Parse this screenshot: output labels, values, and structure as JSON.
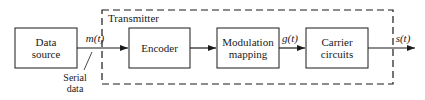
{
  "diagram": {
    "container_label": "Transmitter",
    "blocks": [
      {
        "id": "data-source",
        "lines": [
          "Data",
          "source"
        ]
      },
      {
        "id": "encoder",
        "lines": [
          "Encoder"
        ]
      },
      {
        "id": "modulation-mapping",
        "lines": [
          "Modulation",
          "mapping"
        ]
      },
      {
        "id": "carrier-circuits",
        "lines": [
          "Carrier",
          "circuits"
        ]
      }
    ],
    "signals": {
      "m": "m(t)",
      "g": "g(t)",
      "s": "s(t)"
    },
    "annotation": [
      "Serial",
      "data"
    ]
  }
}
